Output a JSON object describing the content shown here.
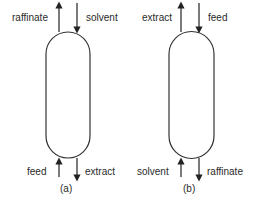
{
  "diagram": {
    "a": {
      "caption": "(a)",
      "top_left_label": "raffinate",
      "top_right_label": "solvent",
      "bottom_left_label": "feed",
      "bottom_right_label": "extract"
    },
    "b": {
      "caption": "(b)",
      "top_left_label": "extract",
      "top_right_label": "feed",
      "bottom_left_label": "solvent",
      "bottom_right_label": "raffinate"
    }
  }
}
